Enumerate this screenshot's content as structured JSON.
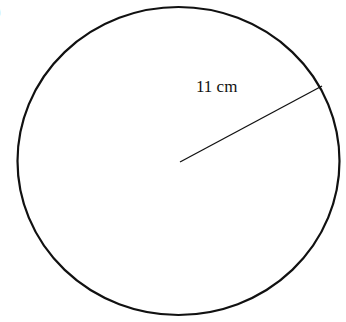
{
  "diagram": {
    "part_label": ")",
    "shape": "circle",
    "radius_label": "11 cm",
    "colors": {
      "stroke": "#111111",
      "background": "#ffffff"
    }
  }
}
